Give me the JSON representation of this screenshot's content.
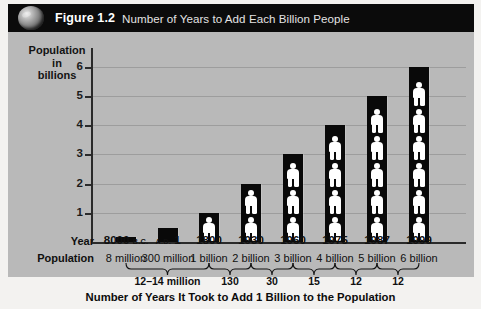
{
  "header": {
    "icon": "globe-icon",
    "figure_number": "Figure 1.2",
    "title": "Number of Years to Add Each Billion People"
  },
  "axis": {
    "y_title_line1": "Population",
    "y_title_line2": "in",
    "y_title_line3": "billions",
    "y_ticks": [
      "1",
      "2",
      "3",
      "4",
      "5",
      "6"
    ]
  },
  "table": {
    "row_label_year": "Year",
    "row_label_population": "Population",
    "footer_title": "Number of Years It Took to Add 1 Billion to the Population"
  },
  "chart_data": {
    "type": "bar",
    "title": "Number of Years to Add Each Billion People",
    "xlabel": "Number of Years It Took to Add 1 Billion to the Population",
    "ylabel": "Population in billions",
    "ylim": [
      0,
      6.5
    ],
    "yticks": [
      1,
      2,
      3,
      4,
      5,
      6
    ],
    "grid": true,
    "legend": "none",
    "categories": [
      "8000 B.C.",
      "A.D. 1",
      "1800",
      "1930",
      "1960",
      "1975",
      "1987",
      "1999"
    ],
    "year_labels_main": [
      "8000",
      "1",
      "1800",
      "1930",
      "1960",
      "1975",
      "1987",
      "1999"
    ],
    "year_labels_era": [
      "B.C.",
      "A.D.",
      "",
      "",
      "",
      "",
      "",
      ""
    ],
    "population_labels": [
      "8 million",
      "300 million",
      "1 billion",
      "2 billion",
      "3 billion",
      "4 billion",
      "5 billion",
      "6 billion"
    ],
    "values": [
      0.008,
      0.3,
      1,
      2,
      3,
      4,
      5,
      6
    ],
    "people_icons": [
      0,
      0,
      1,
      2,
      3,
      4,
      5,
      6
    ],
    "intervals": [
      {
        "label": "12–14 million",
        "from": "8000 B.C.",
        "to": "1800"
      },
      {
        "label": "130",
        "from": "1800",
        "to": "1930"
      },
      {
        "label": "30",
        "from": "1930",
        "to": "1960"
      },
      {
        "label": "15",
        "from": "1960",
        "to": "1975"
      },
      {
        "label": "12",
        "from": "1975",
        "to": "1987"
      },
      {
        "label": "12",
        "from": "1987",
        "to": "1999"
      }
    ]
  },
  "colors": {
    "header_background": "#0b0b0b",
    "panel_background": "#b9b9b9",
    "bar_color": "#090909",
    "figure_color": "#ffffff",
    "page_background": "#f3f2f0"
  }
}
